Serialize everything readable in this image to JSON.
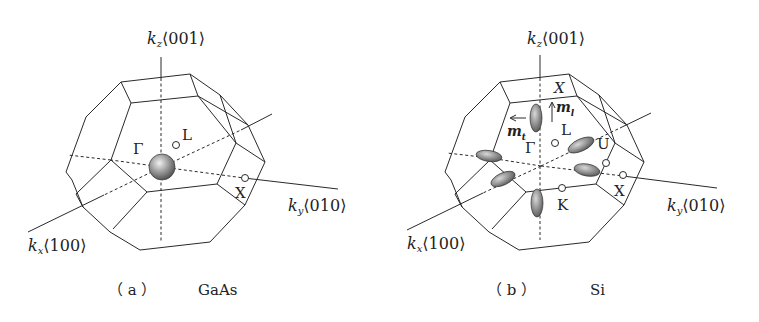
{
  "figure": {
    "panels": [
      {
        "id": "a",
        "caption_letter": "（ a ）",
        "material": "GaAs",
        "axes": {
          "kz": {
            "sym": "k",
            "sub": "z",
            "dir": "⟨001⟩"
          },
          "kx": {
            "sym": "k",
            "sub": "x",
            "dir": "⟨100⟩"
          },
          "ky": {
            "sym": "k",
            "sub": "y",
            "dir": "⟨010⟩"
          }
        },
        "points": {
          "gamma": "Γ",
          "L": "L",
          "X": "X"
        },
        "valley": "spherical constant-energy surface at Γ"
      },
      {
        "id": "b",
        "caption_letter": "（ b ）",
        "material": "Si",
        "axes": {
          "kz": {
            "sym": "k",
            "sub": "z",
            "dir": "⟨001⟩"
          },
          "kx": {
            "sym": "k",
            "sub": "x",
            "dir": "⟨100⟩"
          },
          "ky": {
            "sym": "k",
            "sub": "y",
            "dir": "⟨010⟩"
          }
        },
        "points": {
          "gamma": "Γ",
          "L": "L",
          "X_top": "X",
          "X": "X",
          "U": "U",
          "K": "K"
        },
        "mass_labels": {
          "ml": {
            "sym": "m",
            "sub": "l"
          },
          "mt": {
            "sym": "m",
            "sub": "t"
          }
        },
        "valley": "six ellipsoidal constant-energy surfaces along ⟨100⟩ directions"
      }
    ],
    "colors": {
      "line": "#2a2a2a",
      "valley_fill_light": "#d8d8d8",
      "valley_fill_dark": "#6a6a6a"
    }
  }
}
